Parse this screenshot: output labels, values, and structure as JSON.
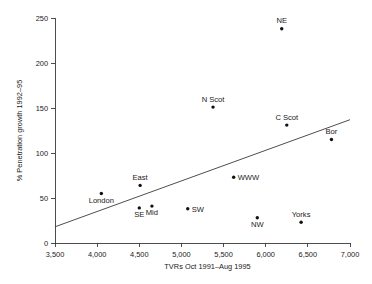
{
  "chart_data": {
    "type": "scatter",
    "title": "",
    "xlabel": "TVRs Oct 1991–Aug 1995",
    "ylabel": "% Penetration growth 1992–95",
    "xlim": [
      3500,
      7000
    ],
    "ylim": [
      0,
      250
    ],
    "xticks": [
      3500,
      4000,
      4500,
      5000,
      5500,
      6000,
      6500,
      7000
    ],
    "xtick_labels": [
      "3,500",
      "4,000",
      "4,500",
      "5,000",
      "5,500",
      "6,000",
      "6,500",
      "7,000"
    ],
    "yticks": [
      0,
      50,
      100,
      150,
      200,
      250
    ],
    "ytick_labels": [
      "0",
      "50",
      "100",
      "150",
      "200",
      "250"
    ],
    "grid": false,
    "legend": "none",
    "points": [
      {
        "label": "London",
        "x": 4050,
        "y": 55,
        "label_pos": "below"
      },
      {
        "label": "East",
        "x": 4510,
        "y": 64,
        "label_pos": "above"
      },
      {
        "label": "SE",
        "x": 4500,
        "y": 39,
        "label_pos": "below"
      },
      {
        "label": "Mid",
        "x": 4650,
        "y": 41,
        "label_pos": "below"
      },
      {
        "label": "SW",
        "x": 5075,
        "y": 38,
        "label_pos": "right"
      },
      {
        "label": "N Scot",
        "x": 5375,
        "y": 151,
        "label_pos": "above"
      },
      {
        "label": "WWW",
        "x": 5620,
        "y": 73,
        "label_pos": "right"
      },
      {
        "label": "NW",
        "x": 5900,
        "y": 28,
        "label_pos": "below"
      },
      {
        "label": "NE",
        "x": 6190,
        "y": 238,
        "label_pos": "above"
      },
      {
        "label": "C Scot",
        "x": 6250,
        "y": 131,
        "label_pos": "above"
      },
      {
        "label": "Yorks",
        "x": 6420,
        "y": 23,
        "label_pos": "above"
      },
      {
        "label": "Bor",
        "x": 6780,
        "y": 115,
        "label_pos": "above"
      }
    ],
    "trendline": {
      "x_start": 3500,
      "y_start": 18,
      "x_end": 7000,
      "y_end": 137
    }
  },
  "colors": {
    "axis": "#3a3a3a",
    "point": "#111111",
    "text": "#1a1a1a",
    "background": "#ffffff"
  }
}
